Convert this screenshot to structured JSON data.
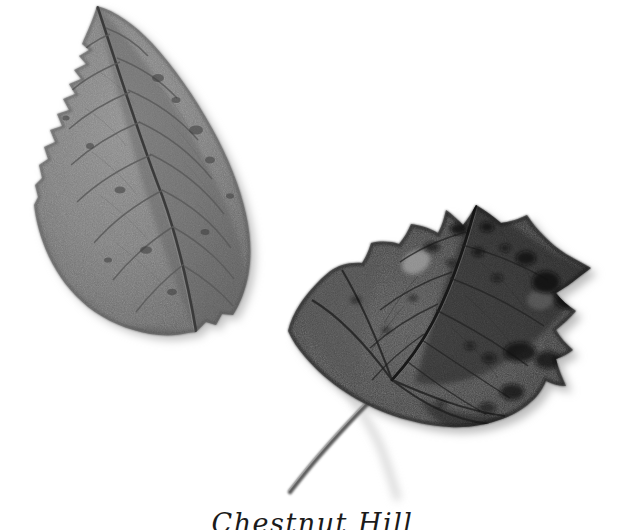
{
  "image": {
    "kind": "botanical-specimen-photograph",
    "medium": "grayscale halftone photograph",
    "background_color": "#ffffff",
    "width": 625,
    "height": 530
  },
  "caption": {
    "text": "Chestnut Hill",
    "note": "cursive caption cropped by the bottom edge of the plate; only the upper portion of the letterforms is visible",
    "color": "#1b1b1b"
  },
  "specimens": [
    {
      "id": "left-leaf",
      "name": "elongate-serrate-leaf",
      "common_shape": "ovate-lanceolate",
      "margin": "serrate",
      "venation": "pinnate",
      "petiole_visible": false,
      "tone": "#7b7b7b",
      "tone_dark": "#4a4a4a",
      "tone_light": "#9a9a9a",
      "apex_point": [
        97,
        6
      ],
      "base_point": [
        196,
        332
      ],
      "bbox": [
        33,
        5,
        250,
        335
      ]
    },
    {
      "id": "right-leaf",
      "name": "broad-deltoid-spotted-leaf",
      "common_shape": "deltoid-ovate",
      "margin": "irregularly lobed and toothed",
      "venation": "pinnate",
      "petiole_visible": true,
      "petiole_tip": [
        290,
        492
      ],
      "tone": "#3c3c3c",
      "tone_dark": "#141414",
      "tone_light": "#6e6e6e",
      "spots": "dark necrotic blotches scattered over the blade",
      "apex_point": [
        476,
        205
      ],
      "bbox": [
        288,
        203,
        592,
        493
      ]
    }
  ],
  "palette": {
    "paper": "#ffffff",
    "leaf_left_mid": "#7b7b7b",
    "leaf_right_mid": "#3c3c3c",
    "ink": "#1b1b1b",
    "shadow": "#c9c9c9"
  }
}
